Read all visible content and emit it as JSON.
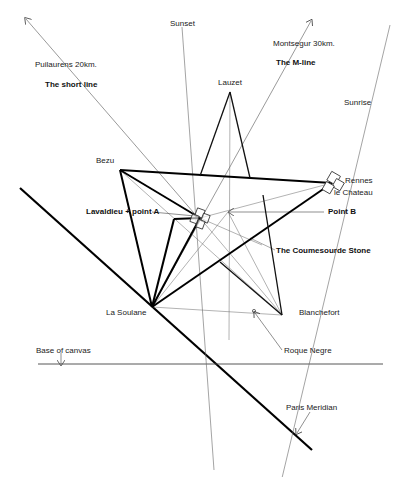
{
  "labels": {
    "sunset": "Sunset",
    "montsegur": "Montsegur 30km.",
    "m_line": "The M-line",
    "puilaurens": "Puilaurens 20km.",
    "short_line": "The short  line",
    "lauzet": "Lauzet",
    "sunrise": "Sunrise",
    "bezu": "Bezu",
    "rennes_1": "Rennes",
    "rennes_2": "le Chateau",
    "lavaldieu": "Lavaldieu + point A",
    "point_b": "Point B",
    "coumesourde": "The Coumesourde Stone",
    "la_soulane": "La Soulane",
    "blanchefort": "Blanchefort",
    "roque_negre": "Roque Negre",
    "base_of_canvas": "Base of canvas",
    "paris_meridian": "Paris Meridian"
  },
  "points": {
    "bezu": [
      120,
      170
    ],
    "rennes_le_chateau": [
      332,
      183
    ],
    "la_soulane": [
      152,
      307
    ],
    "blanchefort": [
      282,
      315
    ],
    "lauzet": [
      230,
      92
    ],
    "point_a": [
      200,
      218
    ],
    "point_b": [
      228,
      212
    ],
    "roque_negre": [
      253,
      312
    ]
  },
  "colors": {
    "thick_line": "#000000",
    "thin_line": "#555555",
    "text": "#222222"
  }
}
